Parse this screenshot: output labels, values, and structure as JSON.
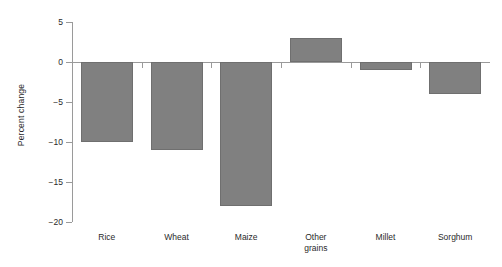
{
  "chart_data": {
    "type": "bar",
    "title": "",
    "subtitle": "",
    "xlabel": "",
    "ylabel": "Percent change",
    "categories": [
      "Rice",
      "Wheat",
      "Maize",
      "Other\ngrains",
      "Millet",
      "Sorghum"
    ],
    "values": [
      -10,
      -11,
      -18,
      3,
      -1,
      -4
    ],
    "ylim": [
      -20,
      5
    ],
    "yticks": [
      5,
      0,
      -5,
      -10,
      -15,
      -20
    ],
    "ytick_labels": [
      "5",
      "0",
      "−5",
      "−10",
      "−15",
      "−20"
    ],
    "grid": false,
    "legend": null,
    "bar_color": "#808080",
    "bar_edge_color": "#6f6f6f",
    "axis_color": "#9a9a9a",
    "background": "#ffffff",
    "annotations": []
  }
}
